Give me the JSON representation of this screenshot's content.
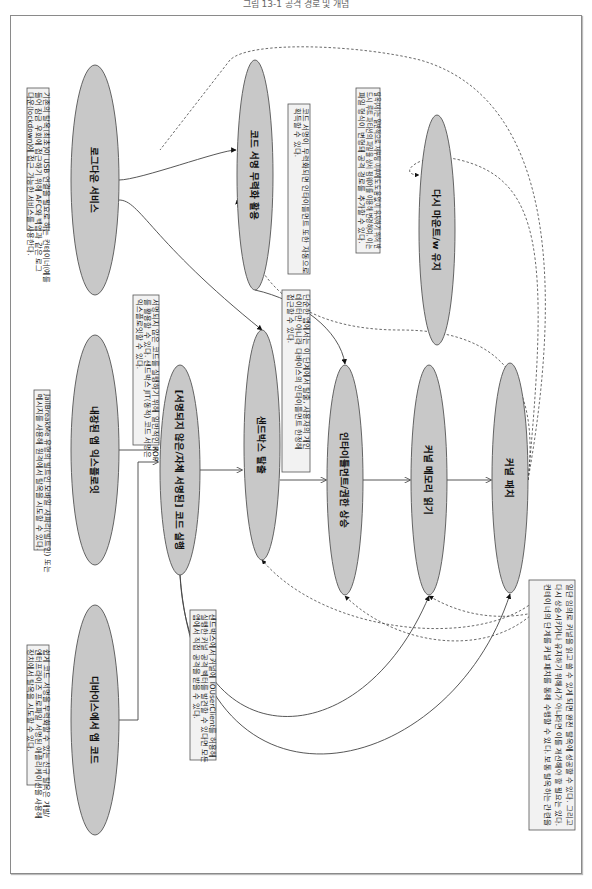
{
  "caption": "그림 13-1 공격 경로 및 개념",
  "diagram": {
    "orientation": "rotated-90-clockwise",
    "nodes": [
      {
        "id": "n1",
        "label": "로그다운 서비스",
        "cx": 95,
        "cy": 180,
        "rx": 24,
        "ry": 115
      },
      {
        "id": "n2",
        "label": "내장된 앱 익스플로잇",
        "cx": 95,
        "cy": 450,
        "rx": 24,
        "ry": 115
      },
      {
        "id": "n3",
        "label": "디바이스에서 앱 코드",
        "cx": 95,
        "cy": 720,
        "rx": 24,
        "ry": 115
      },
      {
        "id": "n4",
        "label": "[서명되지 않은/자체 서명된] 코드 실행",
        "cx": 180,
        "cy": 470,
        "rx": 20,
        "ry": 105
      },
      {
        "id": "n5",
        "label": "코드 서명 무력화 활용",
        "cx": 255,
        "cy": 175,
        "rx": 18,
        "ry": 115
      },
      {
        "id": "n6",
        "label": "샌드박스 탈출",
        "cx": 262,
        "cy": 445,
        "rx": 18,
        "ry": 115
      },
      {
        "id": "n7",
        "label": "인타이틀먼트/권한 상승",
        "cx": 345,
        "cy": 480,
        "rx": 18,
        "ry": 115
      },
      {
        "id": "n8",
        "label": "다시 마운트/w 유지",
        "cx": 437,
        "cy": 230,
        "rx": 18,
        "ry": 115
      },
      {
        "id": "n9",
        "label": "커널 메모리 읽기",
        "cx": 429,
        "cy": 480,
        "rx": 18,
        "ry": 115
      },
      {
        "id": "n10",
        "label": "커널 패치",
        "cx": 510,
        "cy": 478,
        "rx": 18,
        "ry": 115
      }
    ],
    "notes": [
      {
        "id": "note-lockdown",
        "x": 27,
        "y": 88,
        "w": 22,
        "h": 142,
        "lines": [
          "기존의 탈옥(최초)이 USB 연결을 필요로 하는 컨테이너(예를",
          "들어 잠금 우회에 접근하기 위해 AFC와 백업과 같은 로그",
          "다운(lockdown)에 접근 가능한 서비스를 사용한다."
        ]
      },
      {
        "id": "note-builtin-app",
        "x": 34,
        "y": 390,
        "w": 16,
        "h": 160,
        "lines": [
          "JailBreakMe 유형의 빌트인 모바일 사파리(빌트인) 또는",
          "메시지를 사용해 원격에서 탈옥을 시도할 수 있다."
        ]
      },
      {
        "id": "note-app-code",
        "x": 27,
        "y": 645,
        "w": 22,
        "h": 140,
        "lines": [
          "쉽게 코드 서명을 무력화할 수 있는 신규 탈옥은 개발/",
          "엔터프라이즈 프로파일 서명된 애플리케이션을 사용해",
          "장치에서 탈옥을 시도할 수 있다."
        ]
      },
      {
        "id": "note-unsigned",
        "x": 133,
        "y": 295,
        "w": 26,
        "h": 150,
        "lines": [
          "서명되지 않은 코드를 실행하기 위해 일반적인 ROP",
          "를 활용할 수 있다. 샌드박스 JIT(동적) 코드 서명은",
          "익스플로잇할 수 있다."
        ]
      },
      {
        "id": "note-sandbox",
        "x": 190,
        "y": 610,
        "w": 26,
        "h": 150,
        "lines": [
          "샌드박스에서 커널에 IOUserClient를 허용해",
          "실행한 커널 공격 벡터를 발견할 수 있다면 모든",
          "앱에서 직접 공격을 받을 수 있다."
        ]
      },
      {
        "id": "note-codesign",
        "x": 288,
        "y": 104,
        "w": 22,
        "h": 170,
        "lines": [
          "코드 서명이 무력화되면 인타이틀먼트 또한 자동으로",
          "획득할 수 있다."
        ]
      },
      {
        "id": "note-entitlement",
        "x": 282,
        "y": 290,
        "w": 28,
        "h": 182,
        "lines": [
          "단순한 앱에서는 이 단계에서 탈출, 사용자의 개인",
          "데이터만 아니라 다바이스의 인타이틀먼트 한정해",
          "접근할 수 있다."
        ]
      },
      {
        "id": "note-remount",
        "x": 356,
        "y": 88,
        "w": 24,
        "h": 165,
        "lines": [
          "탈옥(재)는 일반적으로 재부팅 이후에도 도움 없이 유지하기 위해 반",
          "드시 루트 파티션의 파일을 상세 펌웨어를 이용해 변경하여, 이는",
          "파일 형식이 변형돼 공격 경로를 추가할 수 있다."
        ]
      },
      {
        "id": "note-kernel-patch",
        "x": 529,
        "y": 580,
        "w": 46,
        "h": 250,
        "lines": [
          "일단 임의로 커널을 읽고 쓸 수 있게 되면 완전 탈옥에 성공할 수 있다. 그리고",
          "다시 상승시키거나 유지하기 위해서가 아니라면 이를 개선해야 할 필요는 있다.",
          "컨테이너의 단계를 커널 패치를 통해 수행할 수 있다. 보통 탈옥하는 관련을"
        ]
      }
    ],
    "edges_solid": [
      {
        "from": "n1",
        "to": "n5"
      },
      {
        "from": "n1",
        "to": "n6"
      },
      {
        "from": "n2",
        "to": "n4"
      },
      {
        "from": "n3",
        "to": "n4"
      },
      {
        "from": "n4",
        "to": "n6"
      },
      {
        "from": "n4",
        "to": "n9"
      },
      {
        "from": "n4",
        "to": "n10"
      },
      {
        "from": "n5",
        "to": "n7"
      },
      {
        "from": "n6",
        "to": "n7"
      },
      {
        "from": "n7",
        "to": "n9"
      },
      {
        "from": "n9",
        "to": "n10"
      }
    ],
    "edges_dashed": [
      {
        "from": "n10",
        "to": "n8"
      },
      {
        "from": "n10",
        "to": "n5"
      },
      {
        "from": "n10",
        "to": "n6"
      },
      {
        "from": "n10",
        "to": "n7"
      },
      {
        "from": "n10",
        "to": "n9"
      }
    ],
    "colors": {
      "node_fill": "#c8c8c8",
      "node_stroke": "#555555",
      "note_fill": "#f2f2f2",
      "note_stroke": "#555555",
      "edge": "#444444"
    }
  }
}
